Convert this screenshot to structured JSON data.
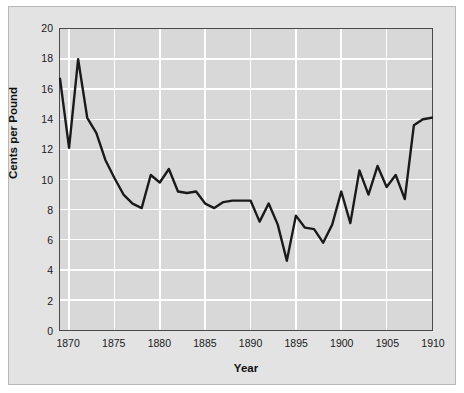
{
  "chart_data": {
    "type": "line",
    "title": "",
    "xlabel": "Year",
    "ylabel": "Cents per Pound",
    "xlim": [
      1869,
      1910
    ],
    "ylim": [
      0,
      20
    ],
    "xticks": [
      1870,
      1875,
      1880,
      1885,
      1890,
      1895,
      1900,
      1905,
      1910
    ],
    "yticks": [
      0,
      2,
      4,
      6,
      8,
      10,
      12,
      14,
      16,
      18,
      20
    ],
    "grid": true,
    "legend": false,
    "series": [
      {
        "name": "Cents per Pound",
        "color": "#1a1a1a",
        "x": [
          1869,
          1870,
          1871,
          1872,
          1873,
          1874,
          1875,
          1876,
          1877,
          1878,
          1879,
          1880,
          1881,
          1882,
          1883,
          1884,
          1885,
          1886,
          1887,
          1888,
          1889,
          1890,
          1891,
          1892,
          1893,
          1894,
          1895,
          1896,
          1897,
          1898,
          1899,
          1900,
          1901,
          1902,
          1903,
          1904,
          1905,
          1906,
          1907,
          1908,
          1909,
          1910
        ],
        "values": [
          16.7,
          12.1,
          18.0,
          14.1,
          13.1,
          11.3,
          10.1,
          9.0,
          8.4,
          8.1,
          10.3,
          9.8,
          10.7,
          9.2,
          9.1,
          9.2,
          8.4,
          8.1,
          8.5,
          8.6,
          8.6,
          8.6,
          7.2,
          8.4,
          7.0,
          4.6,
          7.6,
          6.8,
          6.7,
          5.8,
          7.0,
          9.2,
          7.1,
          10.6,
          9.0,
          10.9,
          9.5,
          10.3,
          8.7,
          13.6,
          14.0,
          14.1
        ]
      }
    ]
  },
  "axes": {
    "ylabel_text": "Cents per Pound",
    "xlabel_text": "Year"
  }
}
